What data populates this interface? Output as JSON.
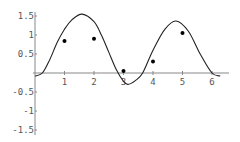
{
  "chart_data": {
    "type": "scatter",
    "title": "",
    "xlabel": "",
    "ylabel": "",
    "xlim": [
      0,
      6.5
    ],
    "ylim": [
      -1.5,
      1.5
    ],
    "grid": false,
    "legend": null,
    "x_ticks": [
      "1",
      "2",
      "3",
      "4",
      "5",
      "6"
    ],
    "y_ticks": [
      "1.5",
      "1",
      "0.5",
      "-0.5",
      "-1",
      "-1.5"
    ],
    "series": [
      {
        "name": "data",
        "kind": "points",
        "x": [
          1,
          2,
          3,
          4,
          5
        ],
        "y": [
          0.84,
          0.9,
          0.05,
          0.3,
          1.05
        ]
      },
      {
        "name": "fit",
        "kind": "line",
        "x": [
          0,
          0.25,
          0.5,
          0.75,
          1,
          1.25,
          1.6,
          2,
          2.25,
          2.5,
          2.75,
          3,
          3.15,
          3.4,
          3.65,
          4,
          4.4,
          4.78,
          5.2,
          5.6,
          6,
          6.28
        ],
        "y": [
          -0.08,
          0,
          0.35,
          0.8,
          1.15,
          1.4,
          1.55,
          1.35,
          1.0,
          0.55,
          0.1,
          -0.22,
          -0.3,
          -0.2,
          0.0,
          0.6,
          1.15,
          1.37,
          1.1,
          0.5,
          0.0,
          -0.08
        ]
      }
    ]
  },
  "colors": {
    "axis": "#888888",
    "curve": "#222222",
    "points": "#000000",
    "labels": "#555555"
  }
}
